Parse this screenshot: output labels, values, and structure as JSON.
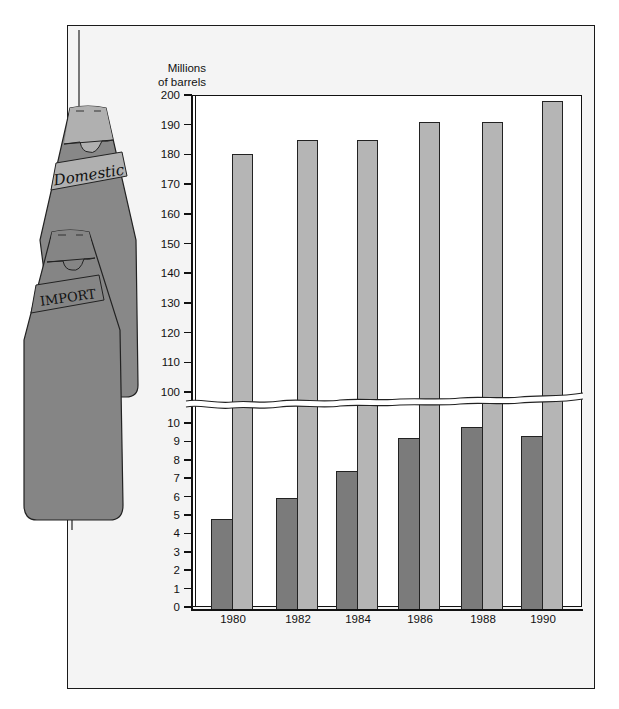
{
  "chart_data": {
    "type": "bar",
    "title": "",
    "ylabel": "Millions of barrels",
    "xlabel": "",
    "categories": [
      "1980",
      "1982",
      "1984",
      "1986",
      "1988",
      "1990"
    ],
    "series": [
      {
        "name": "Import",
        "color": "#7b7b7b",
        "values": [
          4.8,
          5.9,
          7.4,
          9.2,
          9.8,
          9.3
        ]
      },
      {
        "name": "Domestic",
        "color": "#b5b5b5",
        "values": [
          180,
          185,
          185,
          191,
          191,
          198
        ]
      }
    ],
    "y_axis": {
      "broken": true,
      "lower_segment": {
        "range": [
          0,
          10
        ],
        "ticks": [
          "0",
          "1",
          "2",
          "3",
          "4",
          "5",
          "6",
          "7",
          "8",
          "9",
          "10"
        ]
      },
      "upper_segment": {
        "range": [
          100,
          200
        ],
        "ticks": [
          "100",
          "110",
          "120",
          "130",
          "140",
          "150",
          "160",
          "170",
          "180",
          "190",
          "200"
        ]
      }
    },
    "legend": {
      "style": "illustrated bottles",
      "position": "left",
      "entries": [
        "Domestic",
        "IMPORT"
      ]
    },
    "grid": false
  },
  "labels": {
    "ylabel_line1": "Millions",
    "ylabel_line2": "of barrels",
    "bottle_domestic": "Domestic",
    "bottle_import": "IMPORT"
  },
  "ticks_upper": [
    "200",
    "190",
    "180",
    "170",
    "160",
    "150",
    "140",
    "130",
    "120",
    "110",
    "100"
  ],
  "ticks_lower": [
    "10",
    "9",
    "8",
    "7",
    "6",
    "5",
    "4",
    "3",
    "2",
    "1",
    "0"
  ],
  "xcats": [
    "1980",
    "1982",
    "1984",
    "1986",
    "1988",
    "1990"
  ]
}
